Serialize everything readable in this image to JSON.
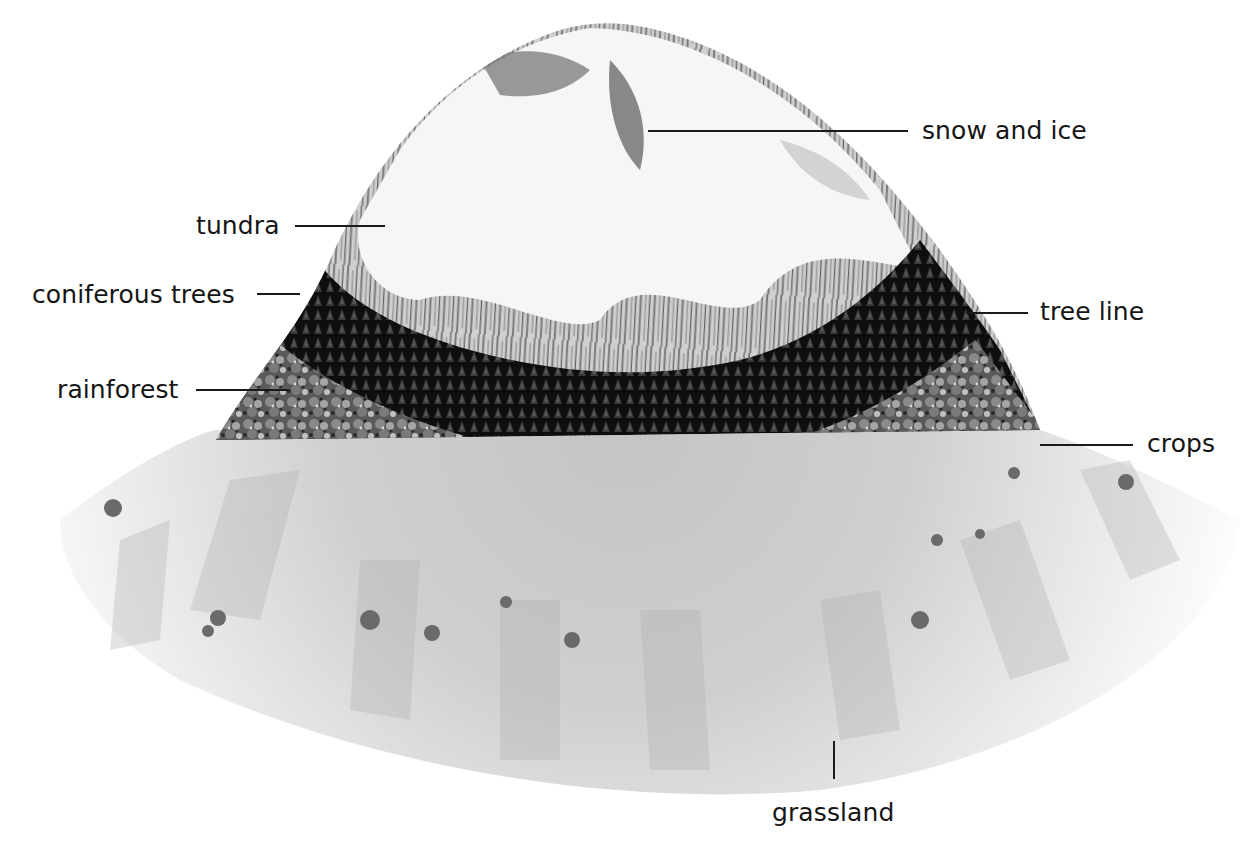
{
  "diagram": {
    "colors": {
      "background": "#ffffff",
      "snow": "#f4f4f4",
      "rock_streak": "#6e6e6e",
      "tundra": "#9a9a9a",
      "coniferous": "#141414",
      "rainforest": "#6a6a6a",
      "grassland": "#d2d2d2",
      "label_text": "#151515"
    },
    "labels": {
      "snow_and_ice": {
        "text": "snow and ice",
        "x": 922,
        "y": 118,
        "line": [
          648,
          131,
          908,
          131
        ]
      },
      "tundra": {
        "text": "tundra",
        "x": 196,
        "y": 213,
        "line": [
          295,
          226,
          385,
          226
        ]
      },
      "coniferous_trees": {
        "text": "coniferous trees",
        "x": 32,
        "y": 282,
        "line": [
          257,
          294,
          300,
          294
        ]
      },
      "tree_line": {
        "text": "tree line",
        "x": 1040,
        "y": 299,
        "line": [
          966,
          313,
          1028,
          313
        ]
      },
      "rainforest": {
        "text": "rainforest",
        "x": 57,
        "y": 377,
        "line": [
          196,
          390,
          288,
          390
        ]
      },
      "crops": {
        "text": "crops",
        "x": 1147,
        "y": 431,
        "line": [
          1040,
          445,
          1133,
          445
        ]
      },
      "grassland": {
        "text": "grassland",
        "x": 772,
        "y": 800,
        "line": [
          834,
          741,
          834,
          779
        ]
      }
    }
  }
}
